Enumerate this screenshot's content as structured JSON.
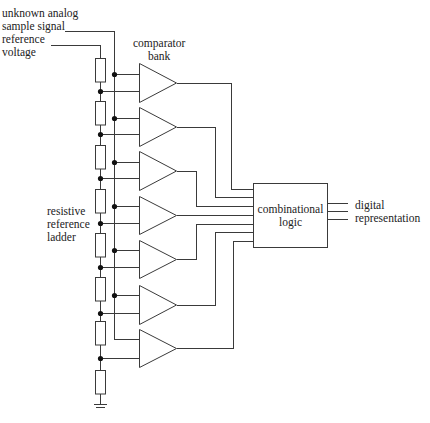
{
  "diagram": {
    "labels": {
      "input_signal": "unknown analog",
      "input_signal_2": "sample signal",
      "reference": "reference",
      "reference_2": "voltage",
      "comparator_bank": "comparator",
      "comparator_bank_2": "bank",
      "ladder": "resistive",
      "ladder_2": "reference",
      "ladder_3": "ladder",
      "logic": "combinational",
      "logic_2": "logic",
      "output": "digital",
      "output_2": "representation"
    },
    "components": {
      "resistors": 8,
      "comparators": 7,
      "logic_block": "combinational logic",
      "output_lines": 3,
      "ground": "ground-symbol"
    },
    "colors": {
      "line": "#3a3a3a",
      "node": "#111111",
      "text": "#222222",
      "background": "#ffffff"
    }
  }
}
